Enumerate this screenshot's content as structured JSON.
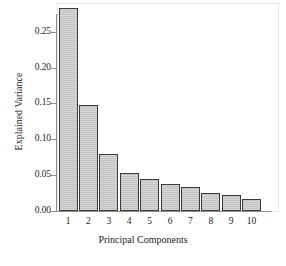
{
  "chart_data": {
    "type": "bar",
    "title": "",
    "xlabel": "Principal Components",
    "ylabel": "Explained Variance",
    "categories": [
      "1",
      "2",
      "3",
      "4",
      "5",
      "6",
      "7",
      "8",
      "9",
      "10"
    ],
    "values": [
      0.283,
      0.148,
      0.079,
      0.053,
      0.045,
      0.038,
      0.033,
      0.0245,
      0.023,
      0.017
    ],
    "ylim": [
      0.0,
      0.29
    ],
    "yticks": [
      0.0,
      0.05,
      0.1,
      0.15,
      0.2,
      0.25
    ],
    "ytick_labels": [
      "0.00",
      "0.05",
      "0.10",
      "0.15",
      "0.20",
      "0.25"
    ],
    "grid": false,
    "legend": null,
    "legend_position": "none",
    "bar_fill_color": "#c6c6c6",
    "bar_edge_color": "#3a3a3a",
    "axis_color": "#8e8e8e",
    "background_color": "#ffffff",
    "text_color": "#1c1c1c"
  }
}
